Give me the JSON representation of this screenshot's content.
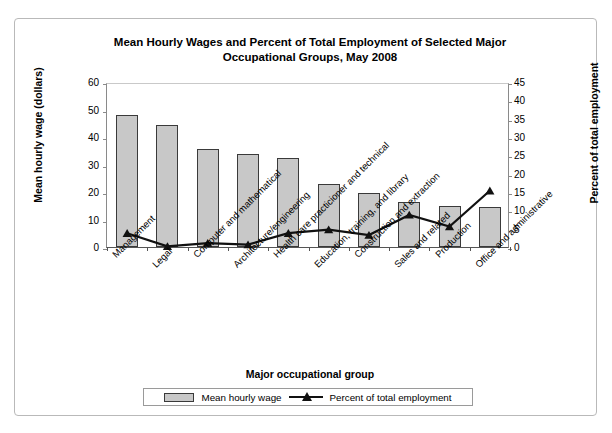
{
  "chart_data": {
    "type": "bar",
    "title": "Mean Hourly Wages and Percent of Total Employment of Selected Major Occupational Groups, May 2008",
    "title_line1": "Mean Hourly Wages and Percent of Total Employment of Selected Major",
    "title_line2": "Occupational Groups, May 2008",
    "xlabel": "Major occupational group",
    "ylabel": "Mean hourly wage (dollars)",
    "ylabel_right": "Percent of  total  employment",
    "grid": false,
    "legend_position": "bottom",
    "categories": [
      "Management",
      "Legal",
      "Computer and mathematical",
      "Architecture/engineering",
      "Health care practicioner and technical",
      "Education, training, and library",
      "Construction and extraction",
      "Sales and related",
      "Production",
      "Office and administrative"
    ],
    "series": [
      {
        "name": "Mean hourly wage",
        "type": "bar",
        "axis": "left",
        "color": "#c8c8c8",
        "values": [
          48.0,
          44.5,
          35.8,
          34.0,
          32.3,
          23.0,
          19.8,
          16.2,
          15.0,
          14.6
        ]
      },
      {
        "name": "Percent of total employment",
        "type": "line",
        "axis": "right",
        "color": "#111111",
        "marker": "triangle",
        "values": [
          4.3,
          0.7,
          1.6,
          1.2,
          4.3,
          5.3,
          3.8,
          9.3,
          6.1,
          15.9
        ]
      }
    ],
    "yaxis_left": {
      "min": 0,
      "max": 60,
      "step": 10,
      "ticks": [
        "0",
        "10",
        "20",
        "30",
        "40",
        "50",
        "60"
      ]
    },
    "yaxis_right": {
      "min": 0,
      "max": 45,
      "step": 5,
      "ticks": [
        "0",
        "5",
        "10",
        "15",
        "20",
        "25",
        "30",
        "35",
        "40",
        "45"
      ]
    },
    "legend": [
      {
        "label": "Mean hourly wage",
        "marker": "bar-swatch"
      },
      {
        "label": "Percent of total employment",
        "marker": "line-triangle-swatch"
      }
    ]
  }
}
